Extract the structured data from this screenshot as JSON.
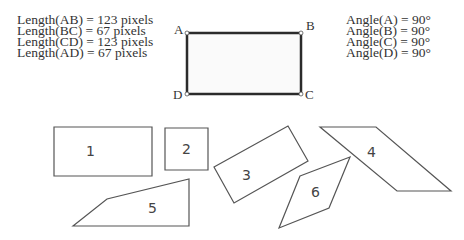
{
  "measurements": {
    "lengths": [
      "Length(AB) = 123 pixels",
      "Length(BC) = 67 pixels",
      "Length(CD) = 123 pixels",
      "Length(AD) = 67 pixels"
    ],
    "angles": [
      "Angle(A) = 90°",
      "Angle(B) = 90°",
      "Angle(C) = 90°",
      "Angle(D) = 90°"
    ]
  },
  "reference_rectangle": {
    "vertices": {
      "A": "A",
      "B": "B",
      "C": "C",
      "D": "D"
    }
  },
  "shapes": [
    {
      "label": "1"
    },
    {
      "label": "2"
    },
    {
      "label": "3"
    },
    {
      "label": "4"
    },
    {
      "label": "5"
    },
    {
      "label": "6"
    }
  ]
}
